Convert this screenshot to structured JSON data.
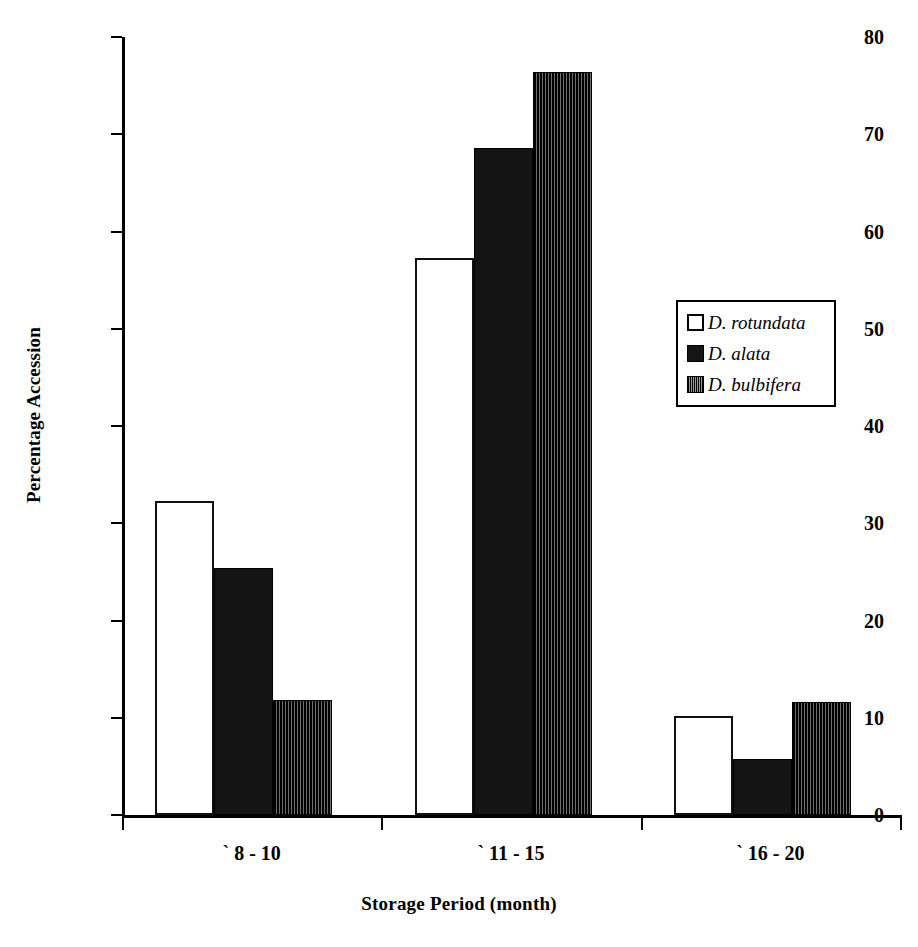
{
  "chart_data": {
    "type": "bar",
    "title": "",
    "xlabel": "Storage Period (month)",
    "ylabel": "Percentage Accession",
    "categories": [
      "` 8 - 10",
      "` 11 - 15",
      "` 16 - 20"
    ],
    "series": [
      {
        "name": "D. rotundata",
        "values": [
          32.3,
          57.3,
          10.2
        ],
        "fill": "white",
        "color": "#ffffff"
      },
      {
        "name": "D. alata",
        "values": [
          25.4,
          68.6,
          5.8
        ],
        "fill": "solid-black",
        "color": "#141414"
      },
      {
        "name": "D. bulbifera",
        "values": [
          11.8,
          76.4,
          11.6
        ],
        "fill": "vertical-hatch",
        "color": "#151515"
      }
    ],
    "ylim": [
      0,
      80
    ],
    "yticks": [
      0,
      10,
      20,
      30,
      40,
      50,
      60,
      70,
      80
    ],
    "ytick_labels": [
      "0",
      "10",
      "20",
      "30",
      "40",
      "50",
      "60",
      "70",
      "80"
    ],
    "grid": false,
    "legend_position": "center-right"
  },
  "legend": {
    "items": [
      {
        "label": "D. rotundata"
      },
      {
        "label": "D. alata"
      },
      {
        "label": "D. bulbifera"
      }
    ]
  }
}
